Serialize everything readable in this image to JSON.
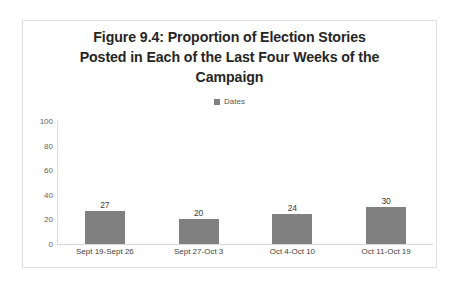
{
  "card": {
    "border_color": "#e0e0e0",
    "background": "#ffffff"
  },
  "title_lines": [
    "Figure 9.4: Proportion of Election Stories",
    "Posted in Each of the Last Four Weeks of the",
    "Campaign"
  ],
  "legend": {
    "label": "Dates",
    "swatch_color": "#808080",
    "position": "top-center"
  },
  "chart_data": {
    "type": "bar",
    "title": "Figure 9.4: Proportion of Election Stories Posted in Each of the Last Four Weeks of the Campaign",
    "categories": [
      "Sept 19-Sept 26",
      "Sept 27-Oct 3",
      "Oct 4-Oct 10",
      "Oct 11-Oct 19"
    ],
    "values": [
      27,
      20,
      24,
      30
    ],
    "series": [
      {
        "name": "Dates",
        "values": [
          27,
          20,
          24,
          30
        ],
        "color": "#808080"
      }
    ],
    "data_labels": [
      "27",
      "20",
      "24",
      "30"
    ],
    "xlabel": "",
    "ylabel": "",
    "ylim": [
      0,
      100
    ],
    "yticks": [
      100,
      80,
      60,
      40,
      20,
      0
    ],
    "ytick_labels": [
      "100",
      "80",
      "60",
      "40",
      "20",
      "0"
    ],
    "grid": false,
    "legend_position": "top-center",
    "bar_color": "#808080",
    "axis_line_color": "#d6d6d6"
  }
}
